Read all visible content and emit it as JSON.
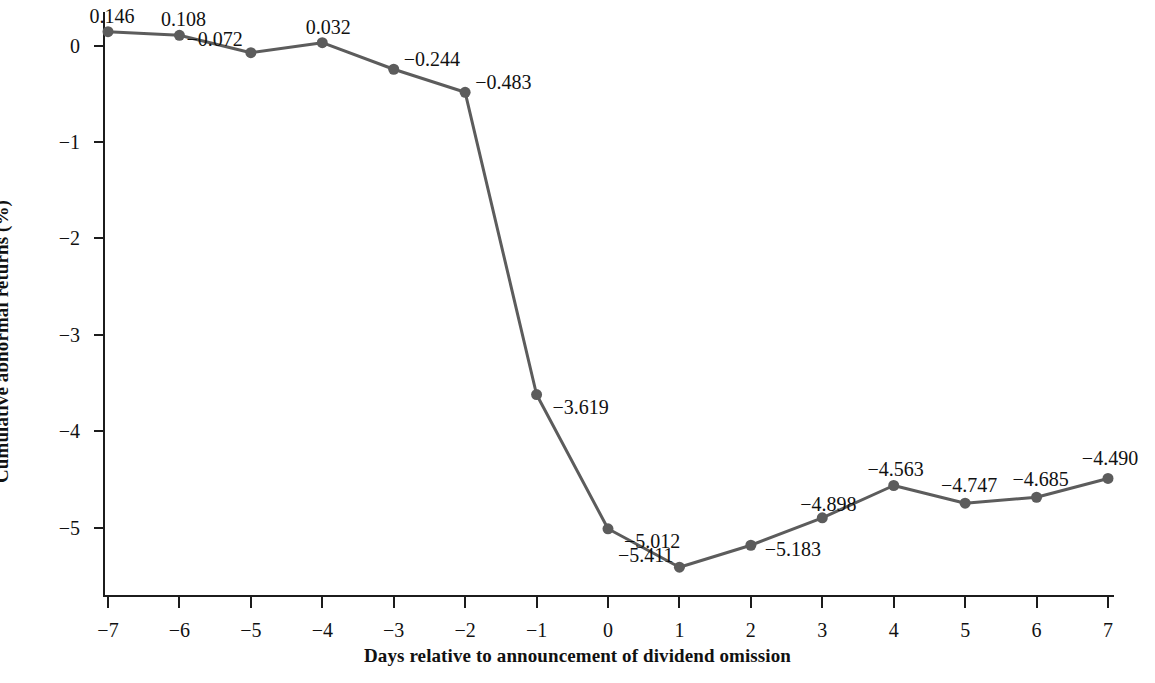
{
  "chart_data": {
    "type": "line",
    "title": "",
    "xlabel": "Days relative to announcement of dividend omission",
    "ylabel": "Cumulative abnormal returns (%)",
    "x": [
      -7,
      -6,
      -5,
      -4,
      -3,
      -2,
      -1,
      0,
      1,
      2,
      3,
      4,
      5,
      6,
      7
    ],
    "values": [
      0.146,
      0.108,
      -0.072,
      0.032,
      -0.244,
      -0.483,
      -3.619,
      -5.012,
      -5.411,
      -5.183,
      -4.898,
      -4.563,
      -4.747,
      -4.685,
      -4.49
    ],
    "data_labels": [
      "0.146",
      "0.108",
      "−0.072",
      "0.032",
      "−0.244",
      "−0.483",
      "−3.619",
      "−5.012",
      "−5.411",
      "−5.183",
      "−4.898",
      "−4.563",
      "−4.747",
      "−4.685",
      "−4.490"
    ],
    "xtick_labels": [
      "−7",
      "−6",
      "−5",
      "−4",
      "−3",
      "−2",
      "−1",
      "0",
      "1",
      "2",
      "3",
      "4",
      "5",
      "6",
      "7"
    ],
    "ytick_values": [
      0,
      -1,
      -2,
      -3,
      -4,
      -5
    ],
    "ytick_labels": [
      "0",
      "−1",
      "−2",
      "−3",
      "−4",
      "−5"
    ],
    "xlim": [
      -7.0,
      7.0
    ],
    "ylim": [
      -5.72,
      0.35
    ],
    "grid": false,
    "legend": null,
    "series_color": "#5c5c5c",
    "marker": "circle",
    "marker_size": 11,
    "line_width": 3,
    "axis_color": "#1c1c1c",
    "background_color": "#ffffff",
    "label_offsets": [
      {
        "dx": 4,
        "dy": -26,
        "anchor": "middle"
      },
      {
        "dx": 4,
        "dy": -26,
        "anchor": "middle"
      },
      {
        "dx": -8,
        "dy": -24,
        "anchor": "end"
      },
      {
        "dx": 6,
        "dy": -26,
        "anchor": "middle"
      },
      {
        "dx": 10,
        "dy": -20,
        "anchor": "start"
      },
      {
        "dx": 10,
        "dy": -20,
        "anchor": "start"
      },
      {
        "dx": 16,
        "dy": 2,
        "anchor": "start"
      },
      {
        "dx": 16,
        "dy": 2,
        "anchor": "start"
      },
      {
        "dx": -6,
        "dy": -22,
        "anchor": "end"
      },
      {
        "dx": 14,
        "dy": -6,
        "anchor": "start"
      },
      {
        "dx": 6,
        "dy": -24,
        "anchor": "middle"
      },
      {
        "dx": 2,
        "dy": -26,
        "anchor": "middle"
      },
      {
        "dx": 4,
        "dy": -28,
        "anchor": "middle"
      },
      {
        "dx": 4,
        "dy": -28,
        "anchor": "middle"
      },
      {
        "dx": 2,
        "dy": -30,
        "anchor": "middle"
      }
    ]
  }
}
